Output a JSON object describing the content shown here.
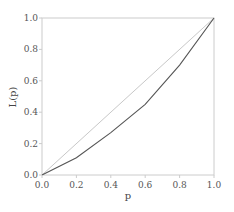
{
  "chart_data": {
    "type": "line",
    "title": "",
    "xlabel": "p",
    "ylabel": "L(p)",
    "xlim": [
      0.0,
      1.0
    ],
    "ylim": [
      0.0,
      1.0
    ],
    "grid": false,
    "x_ticks": [
      "0.0",
      "0.2",
      "0.4",
      "0.6",
      "0.8",
      "1.0"
    ],
    "y_ticks": [
      "0.0",
      "0.2",
      "0.4",
      "0.6",
      "0.8",
      "1.0"
    ],
    "series": [
      {
        "name": "equality line",
        "color": "#c8c8c8",
        "x": [
          0.0,
          1.0
        ],
        "y": [
          0.0,
          1.0
        ]
      },
      {
        "name": "Lorenz curve",
        "color": "#555555",
        "x": [
          0.0,
          0.2,
          0.4,
          0.6,
          0.8,
          1.0
        ],
        "y": [
          0.0,
          0.11,
          0.27,
          0.45,
          0.7,
          1.0
        ]
      }
    ]
  },
  "colors": {
    "axis": "#cccccc",
    "tick_text": "#555555"
  }
}
